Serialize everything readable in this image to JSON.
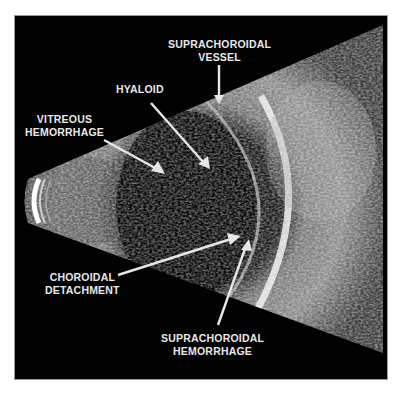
{
  "figure": {
    "type": "B-scan ocular ultrasound",
    "background": "#000000",
    "labels": [
      {
        "id": "supra-vessel",
        "line1": "SUPRACHOROIDAL",
        "line2": "VESSEL"
      },
      {
        "id": "hyaloid",
        "line1": "HYALOID",
        "line2": ""
      },
      {
        "id": "vitreous",
        "line1": "VITREOUS",
        "line2": "HEMORRHAGE"
      },
      {
        "id": "choroidal",
        "line1": "CHOROIDAL",
        "line2": "DETACHMENT"
      },
      {
        "id": "supra-hem",
        "line1": "SUPRACHOROIDAL",
        "line2": "HEMORRHAGE"
      }
    ],
    "arrow_color": "#e6e6e6"
  }
}
